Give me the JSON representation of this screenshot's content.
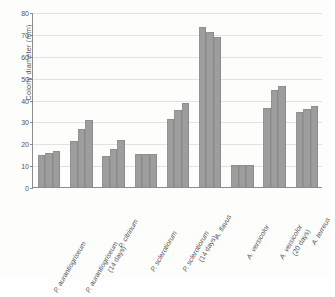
{
  "chart_data": {
    "type": "bar",
    "title": "",
    "xlabel": "",
    "ylabel": "Colony diameter (mm)",
    "ylim": [
      0,
      80
    ],
    "yticks": [
      0,
      10,
      20,
      30,
      40,
      50,
      60,
      70,
      80
    ],
    "grid": true,
    "legend": "none",
    "orientation": "vertical",
    "bar_color": "#9d9d9d",
    "categories": [
      "P. aurantiogriseum",
      "P. aurantiogriseum (14 days)",
      "P. citrinum",
      "P. sclerotiorum",
      "P. sclerotiorum (14 days)",
      "A. flavus",
      "A. versicolor",
      "A. versicolor (20 days)",
      "A. terreus"
    ],
    "category_labels": [
      {
        "species": "P. aurantiogriseum",
        "qualifier": ""
      },
      {
        "species": "P. aurantiogriseum",
        "qualifier": "(14 days)"
      },
      {
        "species": "P. citrinum",
        "qualifier": ""
      },
      {
        "species": "P. sclerotiorum",
        "qualifier": ""
      },
      {
        "species": "P. sclerotiorum",
        "qualifier": "(14 days)"
      },
      {
        "species": "A. flavus",
        "qualifier": ""
      },
      {
        "species": "A. versicolor",
        "qualifier": ""
      },
      {
        "species": "A. versicolor",
        "qualifier": "(20 days)"
      },
      {
        "species": "A. terreus",
        "qualifier": ""
      }
    ],
    "groups": [
      {
        "category": "P. aurantiogriseum",
        "values": [
          14.5,
          15.5,
          16.5
        ]
      },
      {
        "category": "P. aurantiogriseum (14 days)",
        "values": [
          21.0,
          26.5,
          30.5
        ]
      },
      {
        "category": "P. citrinum",
        "values": [
          14.0,
          17.5,
          21.5
        ]
      },
      {
        "category": "P. sclerotiorum",
        "values": [
          15.0,
          15.0,
          15.0
        ]
      },
      {
        "category": "P. sclerotiorum (14 days)",
        "values": [
          31.0,
          35.0,
          38.5
        ]
      },
      {
        "category": "A. flavus",
        "values": [
          73.0,
          71.0,
          68.5
        ]
      },
      {
        "category": "A. versicolor",
        "values": [
          10.0,
          10.0,
          10.0
        ]
      },
      {
        "category": "A. versicolor (20 days)",
        "values": [
          36.0,
          44.5,
          46.0
        ]
      },
      {
        "category": "A. terreus",
        "values": [
          34.5,
          35.5,
          37.0
        ]
      }
    ],
    "series": [
      {
        "name": "bar 1",
        "values": [
          14.5,
          21.0,
          14.0,
          15.0,
          31.0,
          73.0,
          10.0,
          36.0,
          34.5
        ]
      },
      {
        "name": "bar 2",
        "values": [
          15.5,
          26.5,
          17.5,
          15.0,
          35.0,
          71.0,
          10.0,
          44.5,
          35.5
        ]
      },
      {
        "name": "bar 3",
        "values": [
          16.5,
          30.5,
          21.5,
          15.0,
          38.5,
          68.5,
          10.0,
          46.0,
          37.0
        ]
      }
    ]
  }
}
